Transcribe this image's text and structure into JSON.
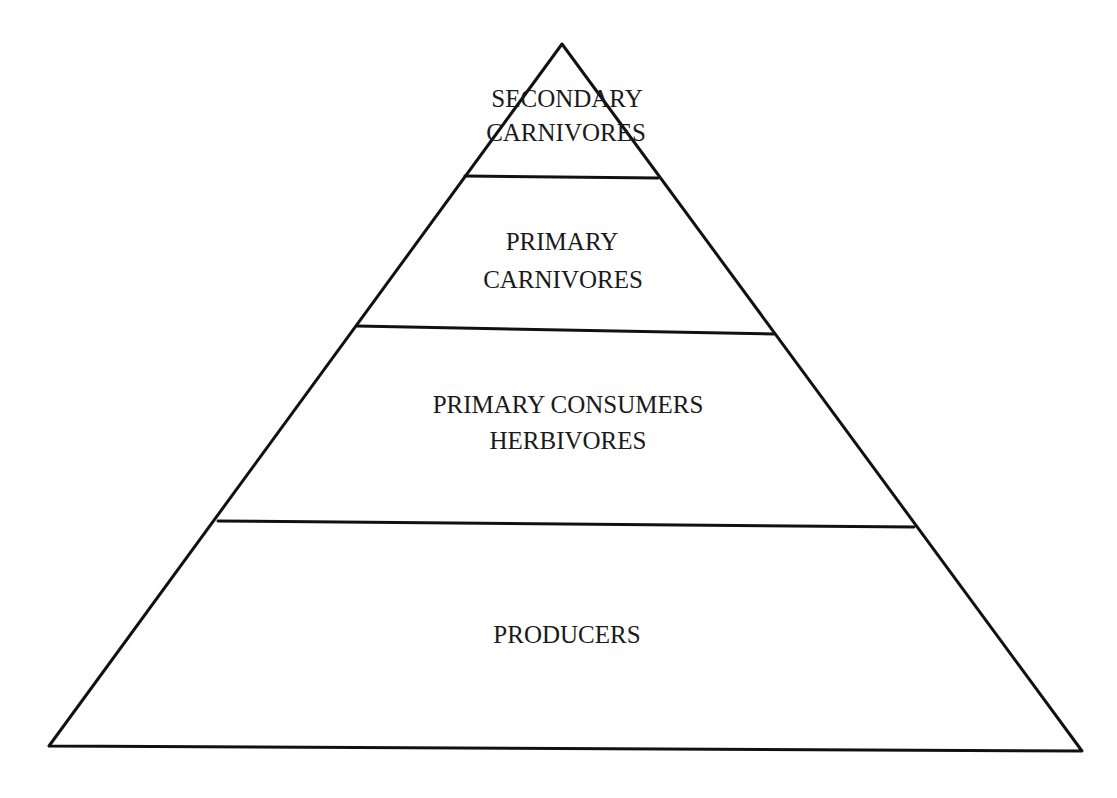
{
  "diagram": {
    "type": "ecological-pyramid",
    "levels": [
      {
        "id": "secondary-carnivores",
        "line1": "SECONDARY",
        "line2": "CARNIVORES"
      },
      {
        "id": "primary-carnivores",
        "line1": "PRIMARY",
        "line2": "CARNIVORES"
      },
      {
        "id": "primary-consumers",
        "line1": "PRIMARY CONSUMERS",
        "line2": "HERBIVORES"
      },
      {
        "id": "producers",
        "line1": "PRODUCERS"
      }
    ],
    "colors": {
      "stroke": "#111111",
      "text": "#1a1a1a",
      "background": "#ffffff"
    }
  }
}
